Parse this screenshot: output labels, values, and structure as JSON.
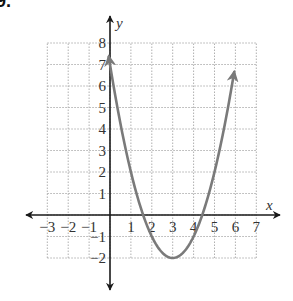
{
  "problem": {
    "label": "9."
  },
  "chart_data": {
    "type": "line",
    "title": "",
    "xlabel": "x",
    "ylabel": "y",
    "xlim": [
      -3,
      7
    ],
    "ylim": [
      -2,
      8
    ],
    "grid": true,
    "grid_style": "dotted",
    "x_ticks": [
      -3,
      -2,
      -1,
      1,
      2,
      3,
      4,
      5,
      6,
      7
    ],
    "y_ticks": [
      -2,
      -1,
      1,
      2,
      3,
      4,
      5,
      6,
      7,
      8
    ],
    "x_tick_labels": [
      "−3",
      "−2",
      "−1",
      "1",
      "2",
      "3",
      "4",
      "5",
      "6",
      "7"
    ],
    "y_tick_labels": [
      "−2",
      "−1",
      "1",
      "2",
      "3",
      "4",
      "5",
      "6",
      "7",
      "8"
    ],
    "series": [
      {
        "name": "parabola",
        "equation": "y = (x - 3)^2 - 2",
        "vertex": [
          3,
          -2
        ],
        "x_intercepts": [
          1.59,
          4.41
        ],
        "y_intercept": 7,
        "x": [
          0,
          1,
          2,
          3,
          4,
          5,
          6
        ],
        "y": [
          7,
          2,
          -1,
          -2,
          -1,
          2,
          7
        ],
        "arrows": "both ends",
        "color": "#7a7a7a"
      }
    ],
    "legend": null
  },
  "colors": {
    "axis": "#1a1a1a",
    "grid": "#b0b0b0",
    "curve": "#7a7a7a",
    "text": "#333333"
  }
}
